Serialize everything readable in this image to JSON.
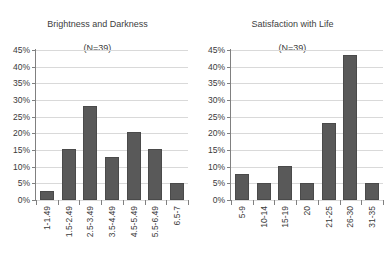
{
  "chart_data": [
    {
      "type": "bar",
      "title": "Brightness and Darkness\n(N=39)",
      "title_line1": "Brightness and Darkness",
      "title_line2": "(N=39)",
      "xlabel": "",
      "ylabel": "",
      "ylim": [
        0,
        45
      ],
      "ytick_values": [
        0,
        5,
        10,
        15,
        20,
        25,
        30,
        35,
        40,
        45
      ],
      "ytick_labels": [
        "0%",
        "5%",
        "10%",
        "15%",
        "20%",
        "25%",
        "30%",
        "35%",
        "40%",
        "45%"
      ],
      "grid": true,
      "legend": "none",
      "bar_color": "#595959",
      "categories": [
        "1-1.49",
        "1.5-2.49",
        "2.5-3.49",
        "3.5-4.49",
        "4.5-5.49",
        "5.5-6.49",
        "6.5-7"
      ],
      "values": [
        2.6,
        15.4,
        28.2,
        12.8,
        20.5,
        15.4,
        5.1
      ]
    },
    {
      "type": "bar",
      "title": "Satisfaction with Life\n(N=39)",
      "title_line1": "Satisfaction with Life",
      "title_line2": "(N=39)",
      "xlabel": "",
      "ylabel": "",
      "ylim": [
        0,
        45
      ],
      "ytick_values": [
        0,
        5,
        10,
        15,
        20,
        25,
        30,
        35,
        40,
        45
      ],
      "ytick_labels": [
        "0%",
        "5%",
        "10%",
        "15%",
        "20%",
        "25%",
        "30%",
        "35%",
        "40%",
        "45%"
      ],
      "grid": true,
      "legend": "none",
      "bar_color": "#595959",
      "categories": [
        "5-9",
        "10-14",
        "15-19",
        "20",
        "21-25",
        "26-30",
        "31-35"
      ],
      "values": [
        7.7,
        5.1,
        10.3,
        5.1,
        23.1,
        43.6,
        5.1
      ]
    }
  ]
}
